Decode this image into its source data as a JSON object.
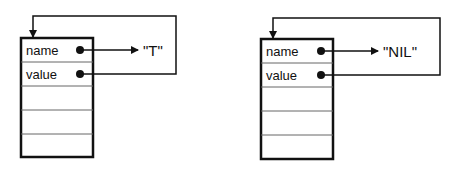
{
  "diagrams": [
    {
      "fields": [
        {
          "label": "name"
        },
        {
          "label": "value"
        },
        {
          "label": ""
        },
        {
          "label": ""
        },
        {
          "label": ""
        }
      ],
      "name_target": "\"T\"",
      "value_target": "self"
    },
    {
      "fields": [
        {
          "label": "name"
        },
        {
          "label": "value"
        },
        {
          "label": ""
        },
        {
          "label": ""
        },
        {
          "label": ""
        }
      ],
      "name_target": "\"NIL\"",
      "value_target": "self"
    }
  ],
  "colors": {
    "stroke": "#111111",
    "divider": "#555555",
    "background": "#ffffff"
  }
}
